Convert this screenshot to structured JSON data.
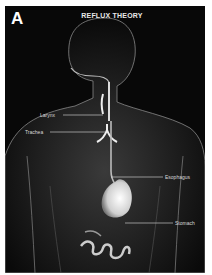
{
  "figure": {
    "panel_letter": "A",
    "title": "REFLUX THEORY",
    "labels": {
      "larynx": "Larynx",
      "trachea": "Trachea",
      "esophagus": "Esophagus",
      "stomach": "Stomach"
    }
  }
}
